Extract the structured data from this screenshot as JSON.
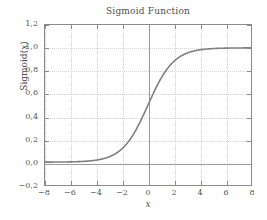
{
  "chart_data": {
    "type": "line",
    "title": "Sigmoid Function",
    "xlabel": "x",
    "ylabel": "Sigmoid(x)",
    "xlim": [
      -8,
      8
    ],
    "ylim": [
      -0.2,
      1.2
    ],
    "grid": true,
    "legend": null,
    "decimal_separator": ",",
    "xticks": [
      -8,
      -6,
      -4,
      -2,
      0,
      2,
      4,
      6,
      8
    ],
    "xtick_labels": [
      "−8",
      "−6",
      "−4",
      "−2",
      "0",
      "2",
      "4",
      "6",
      "8"
    ],
    "yticks": [
      -0.2,
      0.0,
      0.2,
      0.4,
      0.6,
      0.8,
      1.0,
      1.2
    ],
    "ytick_labels": [
      "−0,2",
      "0,0",
      "0,2",
      "0,4",
      "0,6",
      "0,8",
      "1,0",
      "1,2"
    ],
    "series": [
      {
        "name": "Sigmoid(x)",
        "color": "#808080",
        "linewidth": 1.6,
        "x": [
          -8,
          -7.5,
          -7,
          -6.5,
          -6,
          -5.5,
          -5,
          -4.5,
          -4,
          -3.5,
          -3,
          -2.5,
          -2,
          -1.5,
          -1,
          -0.5,
          0,
          0.5,
          1,
          1.5,
          2,
          2.5,
          3,
          3.5,
          4,
          4.5,
          5,
          5.5,
          6,
          6.5,
          7,
          7.5,
          8
        ],
        "y": [
          0.0003,
          0.0006,
          0.0009,
          0.0015,
          0.0025,
          0.0041,
          0.0067,
          0.011,
          0.018,
          0.0293,
          0.0474,
          0.0759,
          0.1192,
          0.1824,
          0.2689,
          0.3775,
          0.5,
          0.6225,
          0.7311,
          0.8176,
          0.8808,
          0.9241,
          0.9526,
          0.9707,
          0.982,
          0.989,
          0.9933,
          0.9959,
          0.9975,
          0.9985,
          0.9991,
          0.9994,
          0.9997
        ]
      }
    ],
    "colors": {
      "curve": "#808080",
      "frame": "#8a8a8a",
      "grid": "#d4d4d4",
      "zero_axis": "#9a9a9a",
      "text": "#4d4d4d",
      "background": "#ffffff"
    }
  }
}
